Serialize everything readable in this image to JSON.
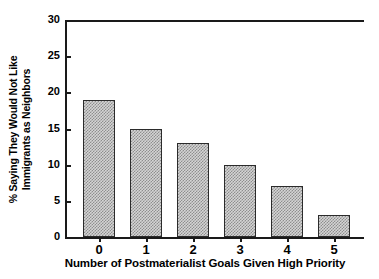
{
  "chart_data": {
    "type": "bar",
    "title": "",
    "subtitle": "",
    "xlabel": "Number of Postmaterialist Goals Given High Priority",
    "ylabel_line1": "% Saying They Would Not Like",
    "ylabel_line2": "Immigrants as Neighbors",
    "categories": [
      "0",
      "1",
      "2",
      "3",
      "4",
      "5"
    ],
    "values": [
      19,
      15,
      13,
      10,
      7,
      3
    ],
    "ylim": [
      0,
      30
    ],
    "yticks": [
      0,
      5,
      10,
      15,
      20,
      25,
      30
    ],
    "ytick_labels": [
      "0",
      "5",
      "10",
      "15",
      "20",
      "25",
      "30"
    ],
    "grid": false,
    "legend": null,
    "legend_position": "none",
    "bar_fill_color": "#d4d4d4",
    "bar_pattern_color": "#8e8e8e",
    "bar_edge_color": "#2b2b2b",
    "axis_color": "#1a1a1a",
    "background_color": "#ffffff",
    "spines": [
      "top",
      "left",
      "bottom"
    ]
  }
}
